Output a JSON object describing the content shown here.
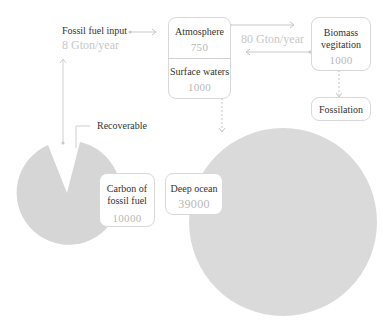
{
  "colors": {
    "circle_fill": "#dadada",
    "box_border": "#d8d8d8",
    "connector": "#c8c8c8",
    "label_text": "#333333",
    "value_text": "#b8b8b8"
  },
  "fossil_input": {
    "label": "Fossil fuel input",
    "rate": "8 Gton/year"
  },
  "atmosphere": {
    "label": "Atmosphere",
    "value": "750"
  },
  "surface_waters": {
    "label": "Surface waters",
    "value": "1000"
  },
  "exchange_flow": {
    "rate": "80 Gton/year"
  },
  "biomass": {
    "label_line1": "Biomass",
    "label_line2": "vegitation",
    "value": "1000"
  },
  "fossilation": {
    "label": "Fossilation"
  },
  "recoverable": {
    "label": "Recoverable"
  },
  "fossil_carbon": {
    "label_line1": "Carbon of",
    "label_line2": "fossil fuel",
    "value": "10000"
  },
  "deep_ocean": {
    "label": "Deep ocean",
    "value": "39000"
  }
}
